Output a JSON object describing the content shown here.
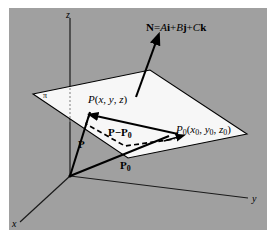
{
  "figure": {
    "background_color": "#ffffff",
    "panel_color": "#a0a0a0",
    "plane_fill": "#f7f7f7",
    "line_color": "#000000",
    "axis_color": "#1a1a1a"
  },
  "axes": {
    "z_label": "z",
    "y_label": "y",
    "x_label": "x"
  },
  "plane": {
    "name_label": "π"
  },
  "normal": {
    "equation_prefix": "N",
    "equals": "=",
    "term_a_coef": "A",
    "term_a_unit": "i",
    "plus_1": "+",
    "term_b_coef": "B",
    "term_b_unit": "j",
    "plus_2": "+",
    "term_c_coef": "C",
    "term_c_unit": "k"
  },
  "points": {
    "p_name": "P",
    "p_coords_open": "(",
    "p_x": "x",
    "p_sep1": ", ",
    "p_y": "y",
    "p_sep2": ", ",
    "p_z": "z",
    "p_coords_close": ")",
    "p0_name": "P",
    "p0_sub": "0",
    "p0_coords_open": "(",
    "p0_x": "x",
    "p0_x_sub": "0",
    "p0_sep1": ", ",
    "p0_y": "y",
    "p0_y_sub": "0",
    "p0_sep2": ", ",
    "p0_z": "z",
    "p0_z_sub": "0",
    "p0_coords_close": ")"
  },
  "vectors": {
    "p_label": "P",
    "p0_label": "P",
    "p0_label_sub": "0",
    "difference_first": "P",
    "difference_minus": "−",
    "difference_second": "P",
    "difference_second_sub": "0"
  }
}
